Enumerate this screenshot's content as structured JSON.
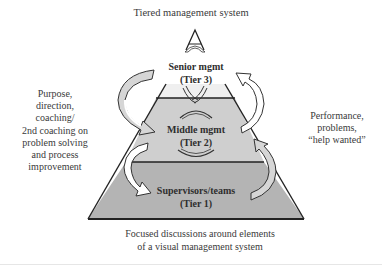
{
  "title": "Tiered management system",
  "left_note": [
    "Purpose,",
    "direction,",
    "coaching/",
    "2nd coaching on",
    "problem solving",
    "and process",
    "improvement"
  ],
  "right_note": [
    "Performance,",
    "problems,",
    "“help wanted”"
  ],
  "bottom_note": [
    "Focused discussions around elements",
    "of a visual management system"
  ],
  "tiers": [
    {
      "name": "Senior mgmt",
      "level": "(Tier 3)",
      "color": "#efefef"
    },
    {
      "name": "Middle mgmt",
      "level": "(Tier 2)",
      "color": "#cfcfcf"
    },
    {
      "name": "Supervisors/teams",
      "level": "(Tier 1)",
      "color": "#b4b4b4"
    }
  ],
  "colors": {
    "outline": "#222222",
    "arrow_fill_light": "#ffffff",
    "arrow_fill_shaded": "#d6d6d6"
  }
}
